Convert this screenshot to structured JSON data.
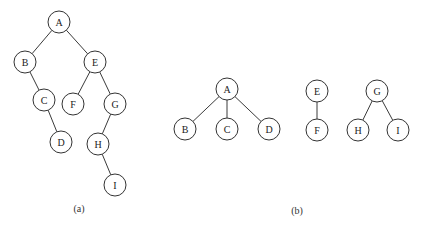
{
  "diagram_a": {
    "caption": "(a)",
    "nodes": [
      {
        "id": "A",
        "label": "A",
        "x": 59,
        "y": 22
      },
      {
        "id": "B",
        "label": "B",
        "x": 25,
        "y": 62
      },
      {
        "id": "E",
        "label": "E",
        "x": 95,
        "y": 62
      },
      {
        "id": "C",
        "label": "C",
        "x": 44,
        "y": 100
      },
      {
        "id": "F",
        "label": "F",
        "x": 73,
        "y": 104
      },
      {
        "id": "G",
        "label": "G",
        "x": 115,
        "y": 104
      },
      {
        "id": "D",
        "label": "D",
        "x": 61,
        "y": 142
      },
      {
        "id": "H",
        "label": "H",
        "x": 98,
        "y": 144
      },
      {
        "id": "I",
        "label": "I",
        "x": 115,
        "y": 185
      }
    ],
    "edges": [
      [
        "A",
        "B"
      ],
      [
        "A",
        "E"
      ],
      [
        "B",
        "C"
      ],
      [
        "C",
        "D"
      ],
      [
        "E",
        "F"
      ],
      [
        "E",
        "G"
      ],
      [
        "G",
        "H"
      ],
      [
        "H",
        "I"
      ]
    ]
  },
  "diagram_b": {
    "caption": "(b)",
    "trees": [
      {
        "nodes": [
          {
            "id": "A",
            "label": "A",
            "x": 227,
            "y": 89
          },
          {
            "id": "B",
            "label": "B",
            "x": 185,
            "y": 129
          },
          {
            "id": "C",
            "label": "C",
            "x": 227,
            "y": 129
          },
          {
            "id": "D",
            "label": "D",
            "x": 269,
            "y": 129
          }
        ],
        "edges": [
          [
            "A",
            "B"
          ],
          [
            "A",
            "C"
          ],
          [
            "A",
            "D"
          ]
        ]
      },
      {
        "nodes": [
          {
            "id": "E",
            "label": "E",
            "x": 317,
            "y": 91
          },
          {
            "id": "F",
            "label": "F",
            "x": 317,
            "y": 130
          }
        ],
        "edges": [
          [
            "E",
            "F"
          ]
        ]
      },
      {
        "nodes": [
          {
            "id": "G",
            "label": "G",
            "x": 377,
            "y": 91
          },
          {
            "id": "H",
            "label": "H",
            "x": 358,
            "y": 130
          },
          {
            "id": "I",
            "label": "I",
            "x": 398,
            "y": 130
          }
        ],
        "edges": [
          [
            "G",
            "H"
          ],
          [
            "G",
            "I"
          ]
        ]
      }
    ]
  },
  "style": {
    "node_radius": 11,
    "stroke_color": "#333333",
    "background": "#ffffff"
  }
}
